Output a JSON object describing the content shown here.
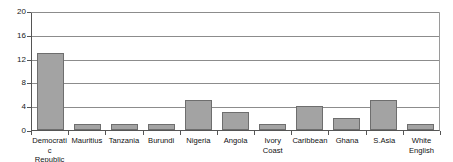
{
  "chart_data": {
    "type": "bar",
    "title": "",
    "subtitle": "",
    "xlabel": "",
    "ylabel": "",
    "categories": [
      "Democratic Republic of",
      "Mauritius",
      "Tanzania",
      "Burundi",
      "Nigeria",
      "Angola",
      "Ivory Coast",
      "Caribbean",
      "Ghana",
      "S.Asia",
      "White English"
    ],
    "values": [
      13,
      1,
      1,
      1,
      5,
      3,
      1,
      4,
      2,
      5,
      1
    ],
    "ylim": [
      0,
      20
    ],
    "yticks": [
      0,
      4,
      8,
      12,
      16,
      20
    ],
    "ytick_labels": [
      "0",
      "4",
      "8",
      "12",
      "16",
      "20"
    ],
    "grid": true,
    "grid_axis": "y",
    "legend": false,
    "legend_position": "none",
    "bar_color": "#a3a3a3",
    "bar_border_color": "#6e6e6e",
    "gridline_color": "#8c8c8c",
    "axis_color": "#555555",
    "background_color": "#ffffff"
  }
}
